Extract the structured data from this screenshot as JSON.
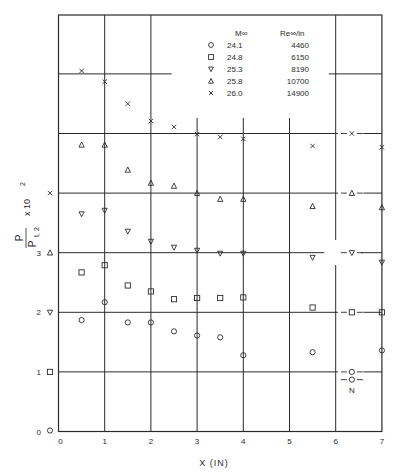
{
  "chart_data": {
    "type": "scatter",
    "title": "",
    "xlabel": "X (IN)",
    "ylabel": "P / P_t,2 x 10^2",
    "ylabel_parts": {
      "num": "P",
      "den": "P",
      "den_sub": "t, 2",
      "mult": "x 10",
      "exp": "2"
    },
    "xlim": [
      0,
      7
    ],
    "ylim": [
      0,
      6.5
    ],
    "x_ticks": [
      "0",
      "1",
      "2",
      "3",
      "4",
      "5",
      "6",
      "7"
    ],
    "y_ticks": [
      {
        "value": 0,
        "label": "0",
        "symbol": "circle"
      },
      {
        "value": 1,
        "label": "1",
        "symbol": "square"
      },
      {
        "value": 2,
        "label": "2",
        "symbol": "triangle-down"
      },
      {
        "value": 3,
        "label": "3",
        "symbol": "triangle-up"
      },
      {
        "value": 4,
        "label": "",
        "symbol": "x"
      }
    ],
    "grid": true,
    "note": "Series are vertically offset; each series' zero is marked on the y-axis by its symbol. Values below are as plotted on the shared y-scale.",
    "legend": {
      "position": "top-right inside",
      "headers": [
        "M∞",
        "Re∞/in"
      ],
      "entries": [
        {
          "symbol": "circle",
          "mach": "24.1",
          "re": "4460"
        },
        {
          "symbol": "square",
          "mach": "24.8",
          "re": "6150"
        },
        {
          "symbol": "triangle-down",
          "mach": "25.3",
          "re": "8190"
        },
        {
          "symbol": "triangle-up",
          "mach": "25.8",
          "re": "10700"
        },
        {
          "symbol": "x",
          "mach": "26.0",
          "re": "14900"
        }
      ]
    },
    "x": [
      0.5,
      1.0,
      1.5,
      2.0,
      2.5,
      3.0,
      3.5,
      4.0,
      5.5,
      7.0
    ],
    "series": [
      {
        "name": "M 24.1 / Re 4460",
        "symbol": "circle",
        "offset": 0,
        "values": [
          1.87,
          2.17,
          1.83,
          1.83,
          1.68,
          1.61,
          1.58,
          1.28,
          1.33,
          1.36
        ]
      },
      {
        "name": "M 24.8 / Re 6150",
        "symbol": "square",
        "offset": 1,
        "values": [
          2.67,
          2.79,
          2.45,
          2.35,
          2.22,
          2.24,
          2.24,
          2.25,
          2.08,
          2.0
        ]
      },
      {
        "name": "M 25.3 / Re 8190",
        "symbol": "triangle-down",
        "offset": 2,
        "values": [
          3.65,
          3.71,
          3.36,
          3.19,
          3.09,
          3.04,
          2.99,
          2.99,
          2.92,
          2.84
        ]
      },
      {
        "name": "M 25.8 / Re 10700",
        "symbol": "triangle-up",
        "offset": 3,
        "values": [
          4.81,
          4.81,
          4.39,
          4.17,
          4.12,
          4.0,
          3.9,
          3.9,
          3.78,
          3.76
        ]
      },
      {
        "name": "M 26.0 / Re 14900",
        "symbol": "x",
        "offset": 4,
        "values": [
          6.05,
          5.87,
          5.5,
          5.21,
          5.11,
          4.99,
          4.94,
          4.91,
          4.79,
          4.77
        ]
      }
    ],
    "reference_markers": [
      {
        "symbol": "x",
        "y": 5.0,
        "x": 6.35
      },
      {
        "symbol": "triangle-up",
        "y": 4.0,
        "x": 6.35
      },
      {
        "symbol": "triangle-down",
        "y": 3.0,
        "x": 6.35
      },
      {
        "symbol": "square",
        "y": 2.0,
        "x": 6.35
      },
      {
        "symbol": "circle",
        "y": 1.0,
        "x": 6.35
      },
      {
        "symbol": "circle",
        "y": 0.87,
        "x": 6.35
      }
    ],
    "annotations": [
      {
        "text": "N",
        "x": 6.35,
        "y": 0.72
      }
    ]
  }
}
